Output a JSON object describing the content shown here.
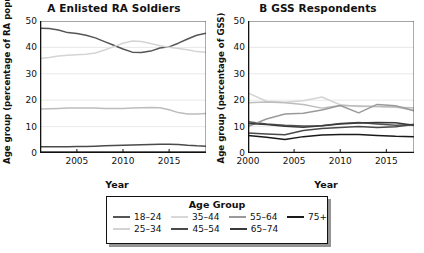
{
  "figure": {
    "legend_title": "Age Group",
    "series_order": [
      "18–24",
      "25–34",
      "35–44",
      "45–54",
      "55–64",
      "65–74",
      "75+"
    ],
    "colors": {
      "18–24": "#555555",
      "25–34": "#d4d4d4",
      "35–44": "#bdbdbd",
      "45–54": "#4a4a4a",
      "55–64": "#9a9a9a",
      "65–74": "#3a3a3a",
      "75+": "#1a1a1a"
    },
    "axis_color": "#111111",
    "grid_color": "#e3e3e3"
  },
  "legend": {
    "title": "Age Group",
    "row1": [
      {
        "label": "18–24",
        "color": "#555555"
      },
      {
        "label": "35–44",
        "color": "#d8d8d8"
      },
      {
        "label": "55–64",
        "color": "#9a9a9a"
      },
      {
        "label": "75+",
        "color": "#1a1a1a"
      }
    ],
    "row2": [
      {
        "label": "25–34",
        "color": "#d4d4d4"
      },
      {
        "label": "45–54",
        "color": "#4a4a4a"
      },
      {
        "label": "65–74",
        "color": "#3a3a3a"
      }
    ]
  },
  "chart_data": [
    {
      "id": "panel-a",
      "type": "line",
      "title": "A  Enlisted RA Soldiers",
      "xlabel": "Year",
      "ylabel": "Age group (percentage of RA population)",
      "xlim": [
        2001,
        2019
      ],
      "ylim": [
        0,
        50
      ],
      "yticks": [
        0,
        10,
        20,
        30,
        40,
        50
      ],
      "xticks": [
        2005,
        2010,
        2015
      ],
      "xtick_labels": [
        "2005",
        "2010",
        "2015"
      ],
      "grid": true,
      "legend_position": "below-figure",
      "x": [
        2001,
        2002,
        2003,
        2004,
        2005,
        2006,
        2007,
        2008,
        2009,
        2010,
        2011,
        2012,
        2013,
        2014,
        2015,
        2016,
        2017,
        2018,
        2019
      ],
      "series": [
        {
          "name": "18–24",
          "color": "#555555",
          "values": [
            47.3,
            47.2,
            46.6,
            45.6,
            45.3,
            44.6,
            43.6,
            42.2,
            40.8,
            39.4,
            38.2,
            38.1,
            38.6,
            39.8,
            40.2,
            41.6,
            43.2,
            44.6,
            45.4
          ]
        },
        {
          "name": "25–34",
          "color": "#d4d4d4",
          "values": [
            35.8,
            36.2,
            36.7,
            37.0,
            37.2,
            37.4,
            37.9,
            39.0,
            40.3,
            41.6,
            42.4,
            42.2,
            41.5,
            40.6,
            40.1,
            39.6,
            39.1,
            38.4,
            38.2
          ]
        },
        {
          "name": "35–44",
          "color": "#bdbdbd",
          "values": [
            16.7,
            16.8,
            16.9,
            17.0,
            17.0,
            17.0,
            17.0,
            16.9,
            16.9,
            16.9,
            17.0,
            17.1,
            17.2,
            17.1,
            16.4,
            15.3,
            14.8,
            14.8,
            15.0
          ]
        },
        {
          "name": "45–54",
          "color": "#4a4a4a",
          "values": [
            2.4,
            2.4,
            2.4,
            2.4,
            2.5,
            2.5,
            2.6,
            2.7,
            2.8,
            2.9,
            3.0,
            3.1,
            3.2,
            3.3,
            3.3,
            3.2,
            2.9,
            2.7,
            2.6
          ]
        },
        {
          "name": "55–64",
          "color": "#9a9a9a",
          "values": [
            0.5,
            0.5,
            0.5,
            0.5,
            0.5,
            0.5,
            0.5,
            0.5,
            0.5,
            0.5,
            0.5,
            0.5,
            0.5,
            0.5,
            0.5,
            0.5,
            0.5,
            0.5,
            0.5
          ]
        },
        {
          "name": "65–74",
          "color": "#3a3a3a",
          "values": [
            0.15,
            0.15,
            0.15,
            0.15,
            0.15,
            0.15,
            0.15,
            0.15,
            0.15,
            0.15,
            0.15,
            0.15,
            0.15,
            0.15,
            0.15,
            0.15,
            0.15,
            0.15,
            0.15
          ]
        },
        {
          "name": "75+",
          "color": "#1a1a1a",
          "values": [
            0.05,
            0.05,
            0.05,
            0.05,
            0.05,
            0.05,
            0.05,
            0.05,
            0.05,
            0.05,
            0.05,
            0.05,
            0.05,
            0.05,
            0.05,
            0.05,
            0.05,
            0.05,
            0.05
          ]
        }
      ]
    },
    {
      "id": "panel-b",
      "type": "line",
      "title": "B  GSS Respondents",
      "xlabel": "Year",
      "ylabel": "Age group (percentage of GSS)",
      "xlim": [
        2000,
        2018
      ],
      "ylim": [
        0,
        50
      ],
      "yticks": [
        0,
        10,
        20,
        30,
        40,
        50
      ],
      "xticks": [
        2000,
        2005,
        2010,
        2015
      ],
      "xtick_labels": [
        "2000",
        "2005",
        "2010",
        "2015"
      ],
      "grid": true,
      "legend_position": "below-figure",
      "x": [
        2000,
        2002,
        2004,
        2006,
        2008,
        2010,
        2012,
        2014,
        2016,
        2018
      ],
      "series": [
        {
          "name": "18–24",
          "color": "#555555",
          "values": [
            11.8,
            11.0,
            10.5,
            10.2,
            10.3,
            11.2,
            11.6,
            11.0,
            10.5,
            10.8
          ]
        },
        {
          "name": "25–34",
          "color": "#d4d4d4",
          "values": [
            22.8,
            19.6,
            19.2,
            19.8,
            21.2,
            18.3,
            17.6,
            17.6,
            17.3,
            16.2
          ]
        },
        {
          "name": "35–44",
          "color": "#bdbdbd",
          "values": [
            19.0,
            19.3,
            19.0,
            18.4,
            17.0,
            18.0,
            17.8,
            17.6,
            17.4,
            17.0
          ]
        },
        {
          "name": "45–54",
          "color": "#4a4a4a",
          "values": [
            7.6,
            7.2,
            6.9,
            8.5,
            9.3,
            9.7,
            10.0,
            9.7,
            9.9,
            10.8
          ]
        },
        {
          "name": "55–64",
          "color": "#9a9a9a",
          "values": [
            10.0,
            12.9,
            14.8,
            15.1,
            16.3,
            18.0,
            15.2,
            18.4,
            17.9,
            16.0
          ]
        },
        {
          "name": "65–74",
          "color": "#3a3a3a",
          "values": [
            11.2,
            10.8,
            10.1,
            9.8,
            10.3,
            11.0,
            11.4,
            11.6,
            11.5,
            10.5
          ]
        },
        {
          "name": "75+",
          "color": "#1a1a1a",
          "values": [
            6.6,
            6.0,
            5.1,
            6.2,
            6.8,
            7.0,
            7.0,
            6.6,
            6.3,
            6.2
          ]
        }
      ]
    }
  ]
}
